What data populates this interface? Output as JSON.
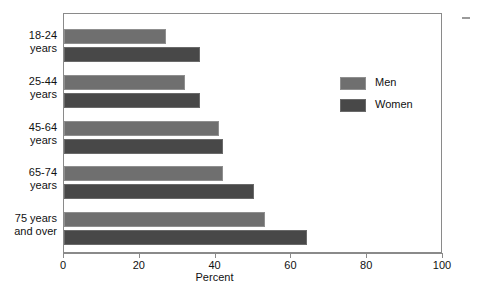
{
  "chart_data": {
    "type": "bar",
    "orientation": "horizontal",
    "title": "",
    "xlabel": "Percent",
    "ylabel": "",
    "xlim": [
      0,
      100
    ],
    "xticks": [
      0,
      20,
      40,
      60,
      80,
      100
    ],
    "xtick_labels": [
      "0",
      "20",
      "40",
      "60",
      "80",
      "100"
    ],
    "grid": false,
    "legend_position": "upper right inside",
    "categories": [
      "18-24\nyears",
      "25-44\nyears",
      "45-64\nyears",
      "65-74\nyears",
      "75 years\nand over"
    ],
    "category_lines": [
      [
        "18-24",
        "years"
      ],
      [
        "25-44",
        "years"
      ],
      [
        "45-64",
        "years"
      ],
      [
        "65-74",
        "years"
      ],
      [
        "75 years",
        "and over"
      ]
    ],
    "series": [
      {
        "name": "Men",
        "color": "#6f6f6f",
        "values": [
          27,
          32,
          41,
          42,
          53
        ]
      },
      {
        "name": "Women",
        "color": "#484848",
        "values": [
          36,
          36,
          42,
          50,
          64
        ]
      }
    ]
  },
  "legend": {
    "items": [
      {
        "label": "Men",
        "color": "#6f6f6f"
      },
      {
        "label": "Women",
        "color": "#484848"
      }
    ]
  },
  "axis": {
    "x_title": "Percent",
    "tick_labels": [
      "0",
      "20",
      "40",
      "60",
      "80",
      "100"
    ]
  },
  "category_labels": [
    {
      "line1": "18-24",
      "line2": "years"
    },
    {
      "line1": "25-44",
      "line2": "years"
    },
    {
      "line1": "45-64",
      "line2": "years"
    },
    {
      "line1": "65-74",
      "line2": "years"
    },
    {
      "line1": "75 years",
      "line2": "and over"
    }
  ]
}
